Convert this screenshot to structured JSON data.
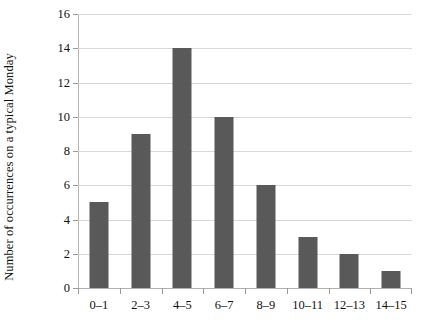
{
  "chart_data": {
    "type": "bar",
    "title": "",
    "subtitle": "",
    "xlabel": "",
    "ylabel": "Number of occurrences on a typical Monday",
    "categories": [
      "0–1",
      "2–3",
      "4–5",
      "6–7",
      "8–9",
      "10–11",
      "12–13",
      "14–15"
    ],
    "values": [
      5,
      9,
      14,
      10,
      6,
      3,
      2,
      1
    ],
    "ylim": [
      0,
      16
    ],
    "ytick_values": [
      0,
      2,
      4,
      6,
      8,
      10,
      12,
      14,
      16
    ],
    "ytick_labels": [
      "0",
      "2",
      "4",
      "6",
      "8",
      "10",
      "12",
      "14",
      "16"
    ],
    "grid": "horizontal",
    "legend": "none",
    "annotations": [],
    "colors": {
      "bar": "#595959",
      "gridline": "#d9d9d9",
      "axis": "#b4b4b4",
      "text": "#111111",
      "background": "#ffffff"
    }
  }
}
